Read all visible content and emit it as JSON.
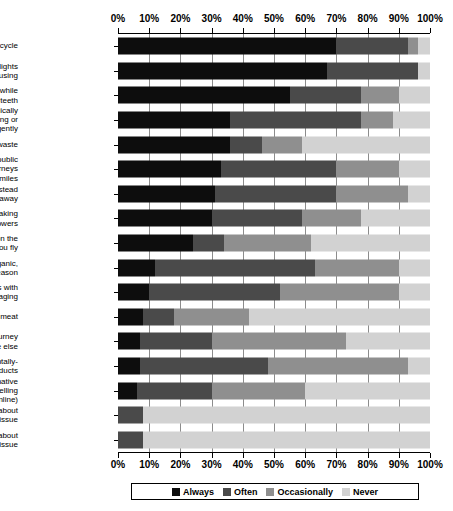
{
  "chart_data": {
    "type": "bar",
    "orientation": "horizontal",
    "stacked": true,
    "stack_mode": "percent",
    "title": "",
    "subtitle": "",
    "xlabel": "",
    "ylabel": "",
    "xlim": [
      0,
      100
    ],
    "grid": true,
    "axis_top": true,
    "axis_bottom": true,
    "legend_position": "bottom",
    "tick_labels": [
      "0%",
      "10%",
      "20%",
      "30%",
      "40%",
      "50%",
      "60%",
      "70%",
      "80%",
      "90%",
      "100%"
    ],
    "tick_values": [
      0,
      10,
      20,
      30,
      40,
      50,
      60,
      70,
      80,
      90,
      100
    ],
    "legend": [
      {
        "name": "Always",
        "color": "#0d0d0d"
      },
      {
        "name": "Often",
        "color": "#4a4a4a"
      },
      {
        "name": "Occasionally",
        "color": "#8f8f8f"
      },
      {
        "name": "Never",
        "color": "#d2d2d2"
      }
    ],
    "categories": [
      "Recycle",
      "Turn off lights\nyou're not using",
      "Turn off the tap while\nyou brush your teeth",
      "Drive economically\n(e.g. braking or\naccelerating gently",
      "Compost your kitchen waste",
      "Walk, cycle or take public\ntransport for short journeys\ni.e. trips of less than 3 miles",
      "Reuse or repair items instead\nof throwing them away",
      "Save water by taking\nshorter showers",
      "Cut down on the\namount you fly",
      "Eat food which is organic,\nlocally-grown or in season",
      "Buy products with\nless packaging",
      "Avoid eating meat",
      "Share a car journey\nwith someone else",
      "Buy environmentally-\nfriendly products",
      "Use an alternative\nto travelling\n(e.g. shopping online)",
      "Take part in a protest about\nan environmental issue",
      "Write to your MP about\nan environmental issue"
    ],
    "series": [
      {
        "name": "Always",
        "values": [
          70,
          67,
          55,
          36,
          36,
          33,
          31,
          30,
          24,
          12,
          10,
          8,
          7,
          7,
          6,
          0,
          0
        ]
      },
      {
        "name": "Often",
        "values": [
          23,
          29,
          23,
          42,
          10,
          37,
          39,
          29,
          10,
          51,
          42,
          10,
          23,
          41,
          24,
          8,
          8
        ]
      },
      {
        "name": "Occasionally",
        "values": [
          3,
          0,
          12,
          10,
          13,
          20,
          23,
          19,
          28,
          27,
          38,
          24,
          43,
          45,
          30,
          0,
          0
        ]
      },
      {
        "name": "Never",
        "values": [
          4,
          4,
          10,
          12,
          41,
          10,
          7,
          22,
          38,
          10,
          10,
          58,
          27,
          7,
          40,
          92,
          92
        ]
      }
    ]
  }
}
